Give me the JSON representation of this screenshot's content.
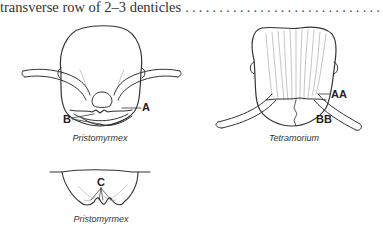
{
  "key": {
    "text": "transverse row of 2–3 denticles",
    "leader": "...................................................................."
  },
  "figures": [
    {
      "id": "pristomyrmex-head",
      "caption": "Pristomyrmex",
      "labels": [
        "A",
        "B"
      ]
    },
    {
      "id": "tetramorium-head",
      "caption": "Tetramorium",
      "labels": [
        "AA",
        "BB"
      ]
    },
    {
      "id": "pristomyrmex-clypeus",
      "caption": "Pristomyrmex",
      "labels": [
        "C"
      ]
    }
  ],
  "colors": {
    "line": "#333333",
    "text": "#222222"
  }
}
